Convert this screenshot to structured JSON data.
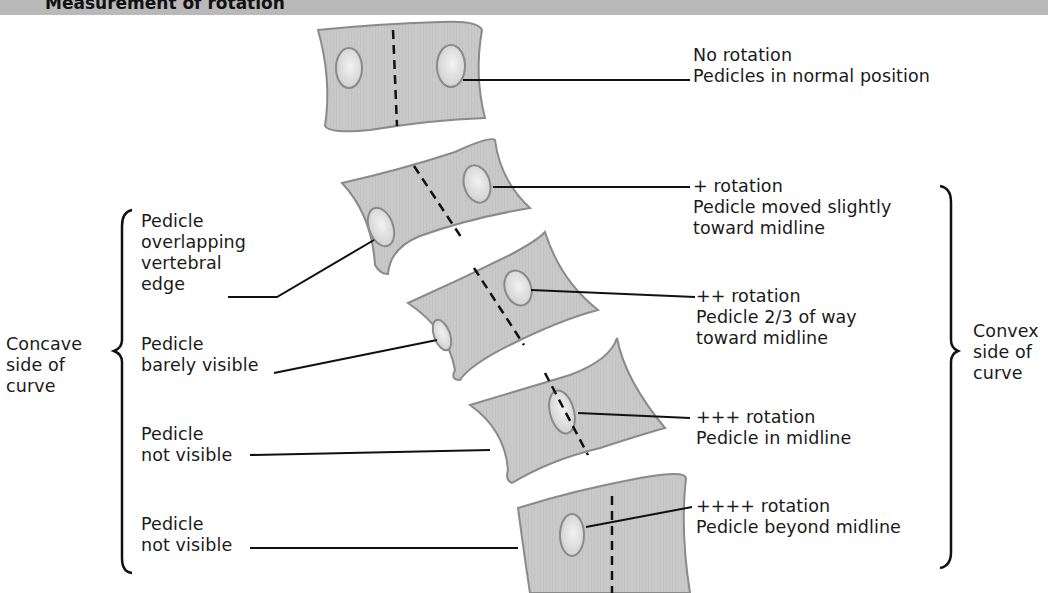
{
  "header": {
    "title": "Measurement of rotation",
    "bar_color": "#b9b9b9"
  },
  "colors": {
    "vertebra_fill": "#c8c8c8",
    "vertebra_edge": "#8a8a8a",
    "pedicle_fill": "#e6e6e6",
    "line": "#111111"
  },
  "right_labels": [
    {
      "grade": "No rotation",
      "description": "Pedicles in normal position"
    },
    {
      "grade": "+ rotation",
      "description": "Pedicle moved slightly",
      "description2": "toward midline"
    },
    {
      "grade": "++ rotation",
      "description": "Pedicle 2/3 of way",
      "description2": "toward midline"
    },
    {
      "grade": "+++ rotation",
      "description": "Pedicle in midline"
    },
    {
      "grade": "++++ rotation",
      "description": "Pedicle beyond midline"
    }
  ],
  "left_labels": [
    {
      "line1": "Pedicle",
      "line2": "overlapping",
      "line3": "vertebral",
      "line4": "edge"
    },
    {
      "line1": "Pedicle",
      "line2": "barely visible"
    },
    {
      "line1": "Pedicle",
      "line2": "not visible"
    },
    {
      "line1": "Pedicle",
      "line2": "not visible"
    }
  ],
  "side_labels": {
    "concave": {
      "line1": "Concave",
      "line2": "side of",
      "line3": "curve"
    },
    "convex": {
      "line1": "Convex",
      "line2": "side of",
      "line3": "curve"
    }
  }
}
